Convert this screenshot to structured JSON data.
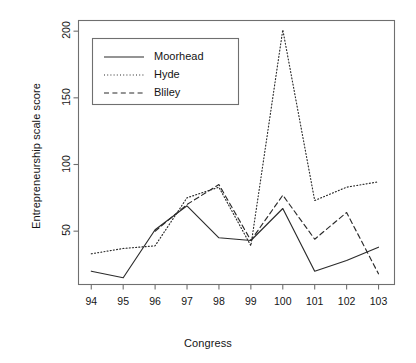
{
  "chart_data": {
    "type": "line",
    "title": "",
    "xlabel": "Congress",
    "ylabel": "Entrepreneurship scale score",
    "categories": [
      "94",
      "95",
      "96",
      "97",
      "98",
      "99",
      "100",
      "101",
      "102",
      "103"
    ],
    "x": [
      94,
      95,
      96,
      97,
      98,
      99,
      100,
      101,
      102,
      103
    ],
    "xlim": [
      93.6,
      103.5
    ],
    "ylim": [
      10,
      208
    ],
    "xticks": [
      "94",
      "95",
      "96",
      "97",
      "98",
      "99",
      "100",
      "101",
      "102",
      "103"
    ],
    "yticks": [
      "50",
      "100",
      "150",
      "200"
    ],
    "ytick_values": [
      50,
      100,
      150,
      200
    ],
    "grid": false,
    "legend_position": "top-left",
    "series": [
      {
        "name": "Moorhead",
        "style": "solid",
        "values": [
          20,
          15,
          51,
          69,
          45,
          43,
          67,
          20,
          28,
          38
        ]
      },
      {
        "name": "Hyde",
        "style": "dotted",
        "values": [
          33,
          37,
          39,
          75,
          83,
          39,
          201,
          73,
          83,
          87
        ]
      },
      {
        "name": "Bliley",
        "style": "dashed",
        "values": [
          null,
          null,
          50,
          70,
          85,
          43,
          77,
          44,
          64,
          18
        ]
      }
    ]
  },
  "legend": {
    "entries": [
      {
        "label": "Moorhead",
        "style": "solid"
      },
      {
        "label": "Hyde",
        "style": "dotted"
      },
      {
        "label": "Bliley",
        "style": "dashed"
      }
    ]
  },
  "colors": {
    "line": "#2b2b2b",
    "axis": "#6f6f6f",
    "text": "#141414",
    "background": "#ffffff"
  }
}
